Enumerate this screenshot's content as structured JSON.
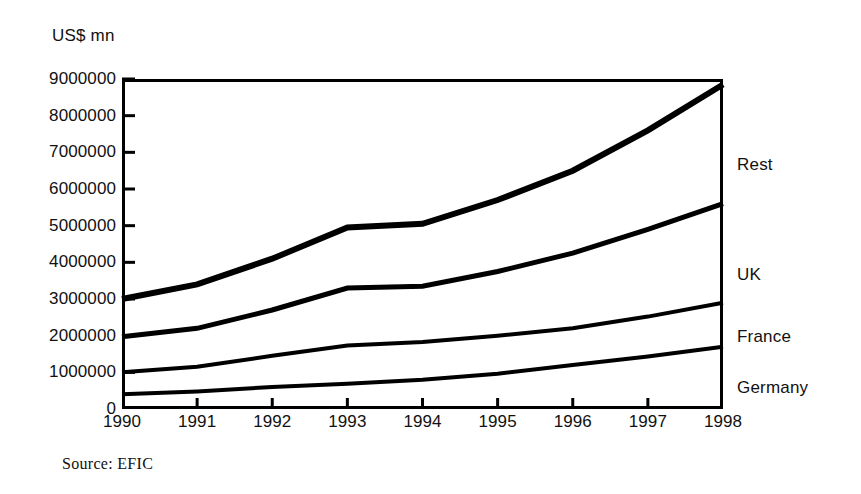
{
  "figure": {
    "unit_label": "US$ mn",
    "source_note": "Source:  EFIC"
  },
  "chart_data": {
    "type": "line",
    "title": "",
    "subtitle": "",
    "xlabel": "",
    "ylabel": "US$ mn",
    "ylim": [
      0,
      9000000
    ],
    "xlim": [
      1990,
      1998
    ],
    "grid": false,
    "legend_position": "right-inline",
    "stacked_cumulative": true,
    "x": [
      1990,
      1991,
      1992,
      1993,
      1994,
      1995,
      1996,
      1997,
      1998
    ],
    "x_tick_labels": [
      "1990",
      "1991",
      "1992",
      "1993",
      "1994",
      "1995",
      "1996",
      "1997",
      "1998"
    ],
    "y_ticks": [
      0,
      1000000,
      2000000,
      3000000,
      4000000,
      5000000,
      6000000,
      7000000,
      8000000,
      9000000
    ],
    "y_tick_labels": [
      "0",
      "1000000",
      "2000000",
      "3000000",
      "4000000",
      "5000000",
      "6000000",
      "7000000",
      "8000000",
      "9000000"
    ],
    "series": [
      {
        "name": "Rest",
        "label": "Rest",
        "color": "#000000",
        "values": [
          3000000,
          3400000,
          4100000,
          4950000,
          5050000,
          5700000,
          6500000,
          7600000,
          8850000
        ]
      },
      {
        "name": "UK",
        "label": "UK",
        "color": "#000000",
        "values": [
          1970000,
          2200000,
          2700000,
          3300000,
          3350000,
          3750000,
          4250000,
          4900000,
          5600000
        ]
      },
      {
        "name": "France",
        "label": "France",
        "color": "#000000",
        "values": [
          1000000,
          1150000,
          1450000,
          1730000,
          1830000,
          2000000,
          2200000,
          2520000,
          2900000
        ]
      },
      {
        "name": "Germany",
        "label": "Germany",
        "color": "#000000",
        "values": [
          400000,
          480000,
          600000,
          690000,
          800000,
          960000,
          1200000,
          1430000,
          1700000
        ]
      }
    ]
  }
}
